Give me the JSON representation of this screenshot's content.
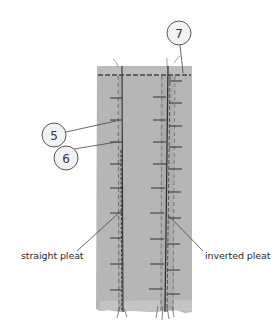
{
  "diagram": {
    "type": "sewing illustration - pleats",
    "colors": {
      "fabric": "#b6b6b6",
      "fabric_top_band": "#bcbcbc",
      "stitch": "#555555",
      "leader": "#444444",
      "callout_fill": "#f2f2f2",
      "callout_stroke": "#555555"
    },
    "callouts": [
      {
        "number": "7",
        "cx": 179,
        "cy": 33
      },
      {
        "number": "5",
        "cx": 54,
        "cy": 135
      },
      {
        "number": "6",
        "cx": 66,
        "cy": 158
      }
    ],
    "labels": {
      "straight_pleat": "straight pleat",
      "inverted_pleat": "inverted pleat"
    }
  }
}
